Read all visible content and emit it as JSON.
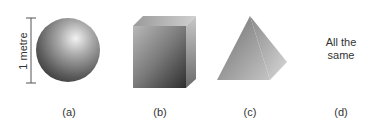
{
  "figure": {
    "dimension_label": "1 metre",
    "options": [
      {
        "id": "a",
        "label": "(a)",
        "shape": "sphere"
      },
      {
        "id": "b",
        "label": "(b)",
        "shape": "cube"
      },
      {
        "id": "c",
        "label": "(c)",
        "shape": "pyramid"
      },
      {
        "id": "d",
        "label": "(d)",
        "shape": "none",
        "text": "All the same"
      }
    ],
    "option_d_lines": [
      "All the",
      "same"
    ]
  }
}
